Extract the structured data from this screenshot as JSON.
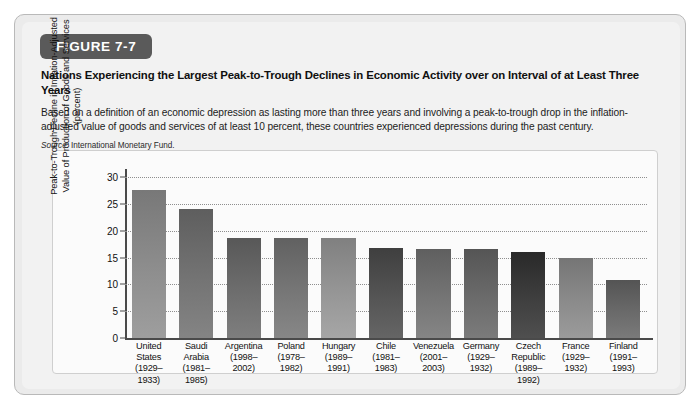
{
  "figure": {
    "badge": "FIGURE 7-7",
    "title": "Nations Experiencing the Largest Peak-to-Trough Declines in Economic Activity over on Interval of at Least Three Years",
    "subtitle": "Based on a definition of an economic depression as lasting more than three years and involving a peak-to-trough drop in the inflation-adjusted value of goods and services of at least 10 percent, these countries experienced depressions during the past century.",
    "source_label": "Source:",
    "source_text": "International Monetary Fund.",
    "badge_color": "#5a5a5a",
    "panel_background": "#fbfbfb",
    "frame_background": "#ebebeb"
  },
  "chart_data": {
    "type": "bar",
    "title": "Nations Experiencing the Largest Peak-to-Trough Declines in Economic Activity over on Interval of at Least Three Years",
    "xlabel": "",
    "ylabel": "Peak-to-Trough Decline in Inflation-Adjusted Value of Production of Goods and Services (percent)",
    "ylim": [
      0,
      30
    ],
    "yticks": [
      0,
      5,
      10,
      15,
      20,
      25,
      30
    ],
    "grid": true,
    "legend": "none",
    "categories": [
      "United States (1929–1933)",
      "Saudi Arabia (1981–1985)",
      "Argentina (1998–2002)",
      "Poland (1978–1982)",
      "Hungary (1989–1991)",
      "Chile (1981–1983)",
      "Venezuela (2001–2003)",
      "Germany (1929–1932)",
      "Czech Republic (1989–1992)",
      "France (1929–1932)",
      "Finland (1991–1993)"
    ],
    "category_lines": [
      [
        "United",
        "States",
        "(1929–",
        "1933)"
      ],
      [
        "Saudi",
        "Arabia",
        "(1981–",
        "1985)"
      ],
      [
        "Argentina",
        "(1998–",
        "2002)"
      ],
      [
        "Poland",
        "(1978–",
        "1982)"
      ],
      [
        "Hungary",
        "(1989–",
        "1991)"
      ],
      [
        "Chile",
        "(1981–",
        "1983)"
      ],
      [
        "Venezuela",
        "(2001–",
        "2003)"
      ],
      [
        "Germany",
        "(1929–",
        "1932)"
      ],
      [
        "Czech",
        "Republic",
        "(1989–",
        "1992)"
      ],
      [
        "France",
        "(1929–",
        "1932)"
      ],
      [
        "Finland",
        "(1991–",
        "1993)"
      ]
    ],
    "values": [
      27.5,
      24.0,
      18.7,
      18.7,
      18.6,
      16.8,
      16.6,
      16.5,
      16.1,
      14.9,
      10.9
    ],
    "bar_colors": [
      "#8e8e8e",
      "#747474",
      "#6e6e6e",
      "#777777",
      "#969696",
      "#555555",
      "#757575",
      "#6b6b6b",
      "#3f3f3f",
      "#8b8b8b",
      "#6a6a6a"
    ]
  }
}
